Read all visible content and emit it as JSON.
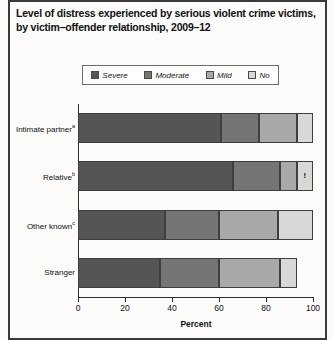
{
  "title": "Level of distress experienced by serious violent crime victims, by victim–offender relationship, 2009–12",
  "axis": {
    "xlabel": "Percent",
    "xticks": [
      "0",
      "20",
      "40",
      "60",
      "80",
      "100"
    ]
  },
  "legend": {
    "items": [
      {
        "label": "Severe",
        "color": "#555555"
      },
      {
        "label": "Moderate",
        "color": "#757575"
      },
      {
        "label": "Mild",
        "color": "#a8a8a8"
      },
      {
        "label": "No",
        "color": "#d8d8d6"
      }
    ]
  },
  "categories": [
    {
      "label": "Intimate partner",
      "note": "a"
    },
    {
      "label": "Relative",
      "note": "b"
    },
    {
      "label": "Other known",
      "note": "c"
    },
    {
      "label": "Stranger",
      "note": ""
    }
  ],
  "marker": {
    "symbol": "!",
    "on_bar": "Relative",
    "on_series": "No"
  },
  "chart_data": {
    "type": "bar",
    "orientation": "horizontal",
    "stacked": true,
    "title": "Level of distress experienced by serious violent crime victims, by victim–offender relationship, 2009–12",
    "xlabel": "Percent",
    "ylabel": "",
    "xlim": [
      0,
      100
    ],
    "xticks": [
      0,
      20,
      40,
      60,
      80,
      100
    ],
    "grid": false,
    "legend_position": "top",
    "categories": [
      "Intimate partner",
      "Relative",
      "Other known",
      "Stranger"
    ],
    "series": [
      {
        "name": "Severe",
        "color": "#555555",
        "values": [
          61,
          66,
          37,
          35
        ]
      },
      {
        "name": "Moderate",
        "color": "#757575",
        "values": [
          16,
          20,
          23,
          25
        ]
      },
      {
        "name": "Mild",
        "color": "#a8a8a8",
        "values": [
          16,
          7,
          25,
          26
        ]
      },
      {
        "name": "No",
        "color": "#d8d8d6",
        "values": [
          7,
          7,
          15,
          7
        ]
      }
    ],
    "annotations": [
      {
        "text": "!",
        "category": "Relative",
        "series": "No",
        "meaning": "interpret with caution"
      }
    ]
  }
}
